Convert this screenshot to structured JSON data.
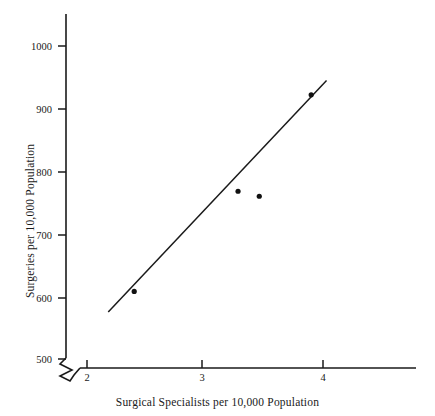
{
  "chart_data": {
    "type": "scatter",
    "title": "",
    "xlabel": "Surgical Specialists per 10,000 Population",
    "ylabel": "Surgeries per 10,000 Population",
    "xlim": [
      1.8,
      4.8
    ],
    "ylim": [
      480,
      1060
    ],
    "grid": false,
    "legend": null,
    "axis_break": {
      "present": true,
      "location": "origin-corner",
      "symbol": "zigzag"
    },
    "xticks": [
      2,
      3,
      4
    ],
    "xtick_labels": [
      "2",
      "3",
      "4"
    ],
    "yticks": [
      500,
      600,
      700,
      800,
      900,
      1000
    ],
    "ytick_labels": [
      "500",
      "600",
      "700",
      "800",
      "900",
      "1000"
    ],
    "points": [
      {
        "x": 2.4,
        "y": 608
      },
      {
        "x": 3.28,
        "y": 768
      },
      {
        "x": 3.46,
        "y": 760
      },
      {
        "x": 3.9,
        "y": 922
      }
    ],
    "series": [
      {
        "name": "observations",
        "type": "scatter",
        "x": [
          2.4,
          3.28,
          3.46,
          3.9
        ],
        "y": [
          608,
          768,
          760,
          922
        ]
      },
      {
        "name": "regression-line",
        "type": "line",
        "x": [
          2.18,
          4.03
        ],
        "y": [
          575,
          945
        ]
      }
    ],
    "marker_color": "#111111",
    "line_color": "#1a1a1a",
    "axis_color": "#1a1a1a"
  }
}
